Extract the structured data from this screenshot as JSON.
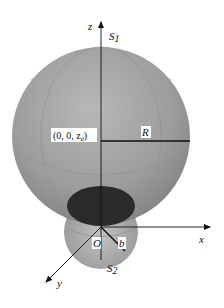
{
  "figure": {
    "type": "3d-geometry-diagram",
    "colors": {
      "large_sphere": "#9a9a9a",
      "small_sphere": "#a8a8a8",
      "contact_ellipse": "#2a2a2a",
      "axes": "#111111",
      "label_box": "#ffffff"
    }
  },
  "labels": {
    "z_axis": "z",
    "x_axis": "x",
    "y_axis": "y",
    "s1": "S",
    "s1_sub": "1",
    "s2": "S",
    "s2_sub": "2",
    "center": "(0, 0, z",
    "center_sub": "d",
    "center_close": ")",
    "radius_large": "R",
    "radius_small": "b",
    "origin": "O"
  }
}
